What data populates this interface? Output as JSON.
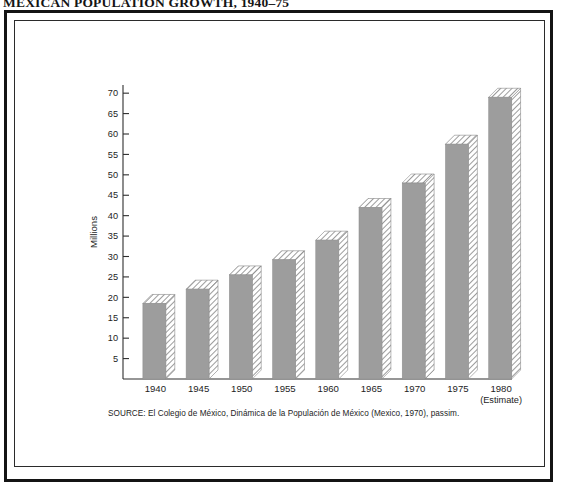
{
  "figure": {
    "title": "MEXICAN POPULATION GROWTH, 1940–75",
    "source_note": "SOURCE: El Colegio de México, Dinámica de la Populación de México (Mexico, 1970), passim."
  },
  "chart_data": {
    "type": "bar",
    "title": "MEXICAN POPULATION GROWTH, 1940–75",
    "xlabel": "",
    "ylabel": "Millions",
    "categories": [
      "1940",
      "1945",
      "1950",
      "1955",
      "1960",
      "1965",
      "1970",
      "1975",
      "1980"
    ],
    "category_sublabels": [
      "",
      "",
      "",
      "",
      "",
      "",
      "",
      "",
      "(Estimate)"
    ],
    "values": [
      18.5,
      22.0,
      25.5,
      29.2,
      34.0,
      42.0,
      48.0,
      57.5,
      69.0
    ],
    "ylim": [
      0,
      72
    ],
    "yticks": [
      5,
      10,
      15,
      20,
      25,
      30,
      35,
      40,
      45,
      50,
      55,
      60,
      65,
      70
    ],
    "ytick_labels": [
      "5",
      "10",
      "15",
      "20",
      "25",
      "30",
      "35",
      "40",
      "45",
      "50",
      "55",
      "60",
      "65",
      "70"
    ],
    "grid": false,
    "legend": false,
    "bar_style": "3d-block-gray-with-hatched-top-and-side",
    "colors": {
      "bar_face": "#9d9d9d",
      "bar_hatch_line": "#7d7d7d",
      "axis": "#2e2e2e",
      "text": "#1d1d1d",
      "background": "#ffffff",
      "frame": "#141414"
    }
  }
}
